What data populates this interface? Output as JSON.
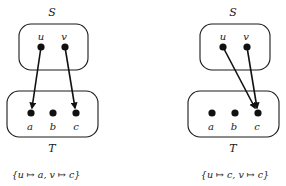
{
  "diagrams": [
    {
      "name": "left",
      "source_set": {
        "label": "S",
        "elements": [
          "u",
          "v"
        ]
      },
      "target_set": {
        "label": "T",
        "elements": [
          "a",
          "b",
          "c"
        ]
      },
      "mapping": [
        {
          "from": "u",
          "to": "a"
        },
        {
          "from": "v",
          "to": "c"
        }
      ],
      "caption": "{u ↦ a, v ↦ c}"
    },
    {
      "name": "right",
      "source_set": {
        "label": "S",
        "elements": [
          "u",
          "v"
        ]
      },
      "target_set": {
        "label": "T",
        "elements": [
          "a",
          "b",
          "c"
        ]
      },
      "mapping": [
        {
          "from": "u",
          "to": "c"
        },
        {
          "from": "v",
          "to": "c"
        }
      ],
      "caption": "{u ↦ c, v ↦ c}"
    }
  ],
  "colors": {
    "ink": "#111111",
    "background": "#ffffff"
  }
}
